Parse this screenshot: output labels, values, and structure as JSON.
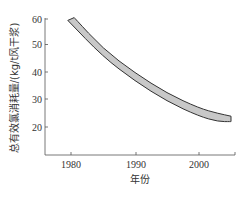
{
  "chart_data": {
    "type": "area",
    "title": "",
    "xlabel": "年份",
    "ylabel": "总有效氯消耗量/(kg/t风干浆)",
    "xlim": [
      1975.8,
      2005.6
    ],
    "ylim": [
      11,
      62
    ],
    "xticks": [
      1980,
      1990,
      2000
    ],
    "yticks": [
      20,
      30,
      40,
      50,
      60
    ],
    "grid": false,
    "legend": null,
    "series": [
      {
        "name": "upper bound",
        "x": [
          1980.5,
          1985,
          1990,
          1995,
          2000,
          2003,
          2005
        ],
        "values": [
          60.5,
          49,
          40,
          32.5,
          27,
          25,
          24
        ]
      },
      {
        "name": "lower bound",
        "x": [
          1979.5,
          1985,
          1990,
          1995,
          2000,
          2003,
          2005
        ],
        "values": [
          59.5,
          46,
          37,
          29.5,
          24,
          22,
          22
        ]
      }
    ],
    "fill_color": "#c8c8c8",
    "line_color": "#333333"
  },
  "axes": {
    "x_ticks": [
      "1980",
      "1990",
      "2000"
    ],
    "y_ticks": [
      "60",
      "50",
      "40",
      "30",
      "20"
    ],
    "x_title": "年份",
    "y_title": "总有效氯消耗量/(kg/t风干浆)"
  }
}
